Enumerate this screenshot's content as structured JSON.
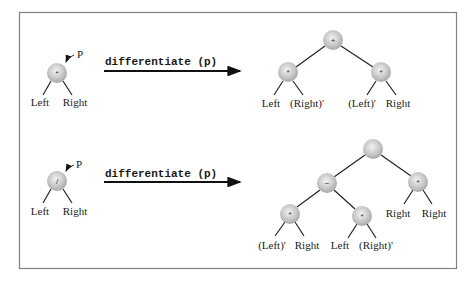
{
  "diagram": {
    "type": "expression-tree-differentiation",
    "panels": [
      {
        "input_tree": {
          "pointer_label": "P",
          "root_symbol": "*",
          "left_label": "Left",
          "right_label": "Right"
        },
        "operation_label": "differentiate (p)",
        "output_tree": {
          "root_symbol": "+",
          "left_node": {
            "symbol": "*",
            "left_label": "Left",
            "right_label": "(Right)'"
          },
          "right_node": {
            "symbol": "*",
            "left_label": "(Left)'",
            "right_label": "Right"
          }
        }
      },
      {
        "input_tree": {
          "pointer_label": "P",
          "root_symbol": "/",
          "left_label": "Left",
          "right_label": "Right"
        },
        "operation_label": "differentiate (p)",
        "output_tree": {
          "root_symbol": "",
          "minus_node": {
            "symbol": "−",
            "left_node": {
              "symbol": "*",
              "left_label": "(Left)'",
              "right_label": "Right"
            },
            "right_node": {
              "symbol": "*",
              "left_label": "Left",
              "right_label": "(Right)'"
            }
          },
          "right_node": {
            "symbol": "*",
            "left_label": "Right",
            "right_label": "Right"
          }
        }
      }
    ],
    "colors": {
      "frame": "#808080",
      "node_fill": "#c8c8c8",
      "edge": "#222222"
    }
  }
}
